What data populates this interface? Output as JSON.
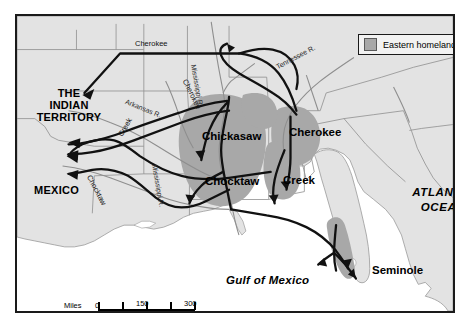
{
  "map": {
    "title_visible": false,
    "legend": {
      "swatch_color": "#a8a8a8",
      "label": "Eastern homelands"
    },
    "region_labels": [
      {
        "name": "indian-territory",
        "text_line1": "THE",
        "text_line2": "INDIAN",
        "text_line3": "TERRITORY"
      },
      {
        "name": "mexico",
        "text": "MEXICO"
      },
      {
        "name": "atlantic-ocean",
        "text_line1": "ATLANTIC",
        "text_line2": "OCEAN"
      },
      {
        "name": "gulf-of-mexico",
        "text": "Gulf of Mexico"
      }
    ],
    "territory": {
      "line1": "THE",
      "line2": "INDIAN",
      "line3": "TERRITORY"
    },
    "mexico": "MEXICO",
    "atlantic": {
      "line1": "ATLANTIC",
      "line2": "OCEAN"
    },
    "gulf": "Gulf of Mexico",
    "tribes": [
      {
        "name": "chickasaw",
        "label": "Chickasaw"
      },
      {
        "name": "cherokee",
        "label": "Cherokee"
      },
      {
        "name": "chocktaw",
        "label": "Chocktaw"
      },
      {
        "name": "creek",
        "label": "Creek"
      },
      {
        "name": "seminole",
        "label": "Seminole"
      }
    ],
    "tribe_labels": {
      "chickasaw": "Chickasaw",
      "cherokee": "Cherokee",
      "chocktaw": "Chocktaw",
      "creek": "Creek",
      "seminole": "Seminole"
    },
    "routes": [
      {
        "name": "cherokee-north",
        "label": "Cherokee"
      },
      {
        "name": "cherokee-east",
        "label": "Cherokee"
      },
      {
        "name": "creek",
        "label": "Creek"
      },
      {
        "name": "chocktaw",
        "label": "Chocktaw"
      }
    ],
    "route_labels": {
      "cherokee_north": "Cherokee",
      "cherokee_east": "Cherokee",
      "creek": "Creek",
      "chocktaw": "Chocktaw"
    },
    "rivers": [
      {
        "name": "arkansas-river",
        "label": "Arkansas R."
      },
      {
        "name": "mississippi-river-north",
        "label": "Mississippi R."
      },
      {
        "name": "mississippi-river-south",
        "label": "Mississippi R."
      },
      {
        "name": "tennessee-river",
        "label": "Tennessee R."
      }
    ],
    "river_labels": {
      "arkansas": "Arkansas R.",
      "mississippi_north": "Mississippi R.",
      "mississippi_south": "Mississippi R.",
      "tennessee": "Tennessee R."
    },
    "scale": {
      "miles_unit": "Miles",
      "km_unit": "Km",
      "miles_ticks": [
        "0",
        "150",
        "300"
      ],
      "km_ticks": [
        "0",
        "150",
        "300"
      ],
      "miles_0": "0",
      "miles_150": "150",
      "miles_300": "300",
      "km_0": "0",
      "km_150": "150",
      "km_300": "300"
    },
    "colors": {
      "homeland_fill": "#a8a8a8",
      "land_fill": "#e3e3e3",
      "water_fill": "#ffffff",
      "route_stroke": "#111111",
      "border_stroke": "#1a1a1a",
      "state_line": "#8e8e8e"
    }
  }
}
